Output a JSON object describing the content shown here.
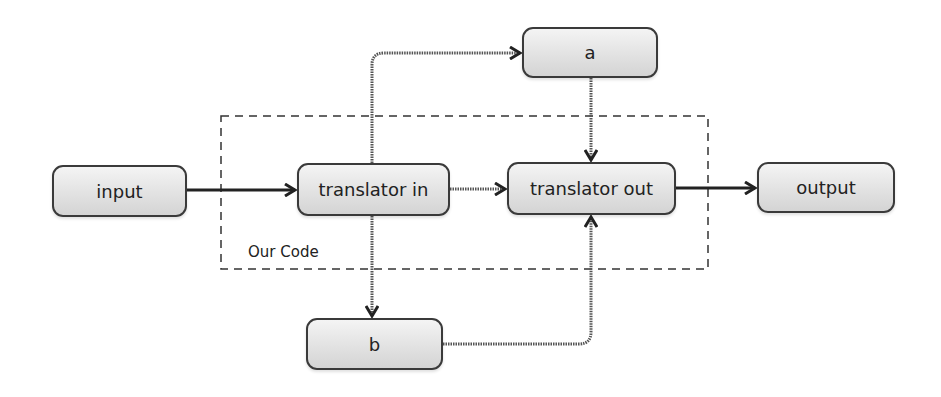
{
  "diagram": {
    "type": "flowchart",
    "nodes": {
      "input": {
        "label": "input"
      },
      "translator_in": {
        "label": "translator in"
      },
      "translator_out": {
        "label": "translator out"
      },
      "output": {
        "label": "output"
      },
      "a": {
        "label": "a"
      },
      "b": {
        "label": "b"
      }
    },
    "group": {
      "label": "Our Code",
      "style": "dashed"
    },
    "edges": [
      {
        "from": "input",
        "to": "translator in",
        "style": "solid"
      },
      {
        "from": "translator in",
        "to": "translator out",
        "style": "dotted"
      },
      {
        "from": "translator in",
        "to": "a",
        "style": "dotted"
      },
      {
        "from": "translator in",
        "to": "b",
        "style": "dotted"
      },
      {
        "from": "a",
        "to": "translator out",
        "style": "dotted"
      },
      {
        "from": "b",
        "to": "translator out",
        "style": "dotted"
      },
      {
        "from": "translator out",
        "to": "output",
        "style": "solid"
      }
    ],
    "colors": {
      "stroke": "#333333",
      "node_fill_top": "#f4f4f4",
      "node_fill_bottom": "#d4d4d4"
    }
  }
}
